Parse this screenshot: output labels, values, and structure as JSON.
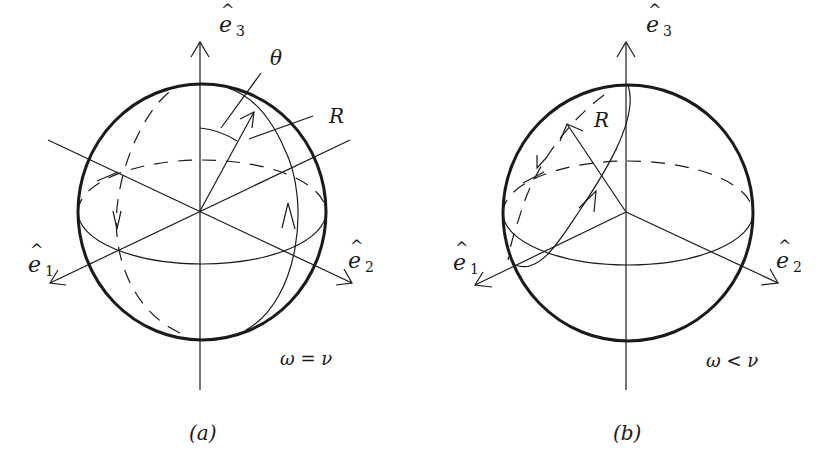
{
  "panels": [
    {
      "id": "a",
      "caption": "(a)",
      "condition": "ω = ν",
      "axes": {
        "e1": {
          "base": "e",
          "sub": "1"
        },
        "e2": {
          "base": "e",
          "sub": "2"
        },
        "e3": {
          "base": "e",
          "sub": "3"
        }
      },
      "labels": {
        "theta": "θ",
        "radius": "R"
      }
    },
    {
      "id": "b",
      "caption": "(b)",
      "condition": "ω < ν",
      "axes": {
        "e1": {
          "base": "e",
          "sub": "1"
        },
        "e2": {
          "base": "e",
          "sub": "2"
        },
        "e3": {
          "base": "e",
          "sub": "3"
        }
      },
      "labels": {
        "radius": "R"
      }
    }
  ],
  "hat_glyph": "^",
  "colors": {
    "ink": "#1a1a1a",
    "background": "#ffffff"
  }
}
